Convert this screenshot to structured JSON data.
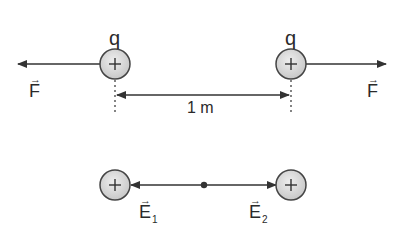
{
  "diagram": {
    "top": {
      "charges": [
        {
          "label": "q",
          "sign": "+"
        },
        {
          "label": "q",
          "sign": "+"
        }
      ],
      "forces": [
        {
          "label": "F",
          "direction": "left"
        },
        {
          "label": "F",
          "direction": "right"
        }
      ],
      "distance": {
        "label": "1 m"
      }
    },
    "bottom": {
      "charges": [
        {
          "sign": "+"
        },
        {
          "sign": "+"
        }
      ],
      "fields": [
        {
          "label": "E",
          "subscript": "1",
          "direction": "left"
        },
        {
          "label": "E",
          "subscript": "2",
          "direction": "right"
        }
      ]
    },
    "colors": {
      "charge_fill": "#d9d9d9",
      "stroke": "#333333",
      "text": "#2a2a2a"
    }
  }
}
